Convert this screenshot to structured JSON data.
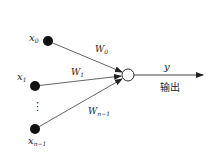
{
  "diagram": {
    "type": "perceptron",
    "inputs": [
      {
        "id": "x0",
        "label": "x",
        "subscript": "0",
        "weight_label": "W",
        "weight_subscript": "0"
      },
      {
        "id": "x1",
        "label": "x",
        "subscript": "1",
        "weight_label": "W",
        "weight_subscript": "1"
      },
      {
        "id": "xn-1",
        "label": "x",
        "subscript": "n−1",
        "weight_label": "W",
        "weight_subscript": "n−1"
      }
    ],
    "ellipsis": "⋮",
    "output": {
      "label": "y",
      "caption": "输出"
    },
    "colors": {
      "node_fill": "#111111",
      "line": "#555555",
      "output_node_fill": "#ffffff"
    }
  }
}
